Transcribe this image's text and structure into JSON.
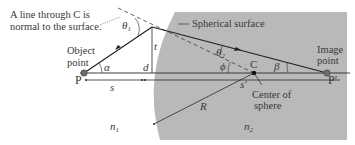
{
  "figure": {
    "note_line1": "A line through C is",
    "note_line2": "normal to the surface.",
    "surface_label": "Spherical surface",
    "object_line1": "Object",
    "object_line2": "point",
    "image_line1": "Image",
    "image_line2": "point",
    "center_line1": "Center of",
    "center_line2": "sphere",
    "point_P": "P",
    "point_P_prime": "P′",
    "point_C": "C",
    "angle_theta1": "θ",
    "angle_theta1_sub": "1",
    "angle_theta2": "θ",
    "angle_theta2_sub": "2",
    "angle_alpha": "α",
    "angle_beta": "β",
    "angle_phi": "ϕ",
    "dist_s": "s",
    "dist_s_prime": "s′",
    "dist_t": "t",
    "dist_d": "d",
    "radius_R": "R",
    "index_n1": "n",
    "index_n1_sub": "1",
    "index_n2": "n",
    "index_n2_sub": "2"
  },
  "colors": {
    "medium2": "#b9b9b9",
    "ray": "#1e1e1e",
    "point": "#6e6e6e"
  }
}
